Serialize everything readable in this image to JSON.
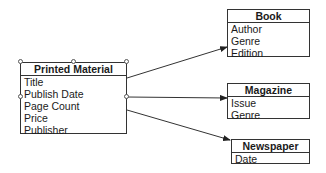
{
  "diagram": {
    "parent": {
      "name": "Printed Material",
      "attributes": [
        "Title",
        "Publish Date",
        "Page Count",
        "Price",
        "Publisher"
      ]
    },
    "children": [
      {
        "name": "Book",
        "attributes": [
          "Author",
          "Genre",
          "Edition"
        ]
      },
      {
        "name": "Magazine",
        "attributes": [
          "Issue",
          "Genre"
        ]
      },
      {
        "name": "Newspaper",
        "attributes": [
          "Date"
        ]
      }
    ],
    "connections": [
      {
        "from": "Printed Material",
        "to": "Book"
      },
      {
        "from": "Printed Material",
        "to": "Magazine"
      },
      {
        "from": "Printed Material",
        "to": "Newspaper"
      }
    ]
  }
}
